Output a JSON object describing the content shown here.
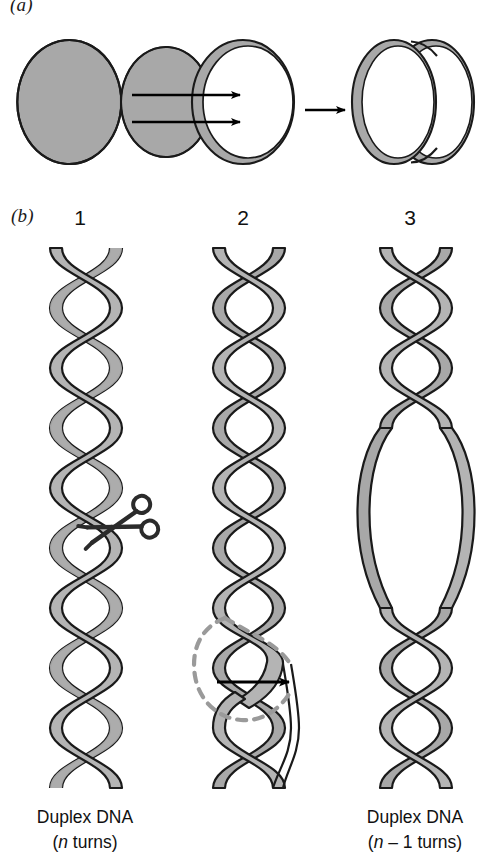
{
  "figure": {
    "title_domain": "DNA topology / supercoiling schematic",
    "background_color": "#ffffff",
    "ribbon_fill": "#a8a8a8",
    "ribbon_stroke": "#1a1a1a",
    "arrow_color": "#000000",
    "dashed_color": "#9a9a9a"
  },
  "panel_a": {
    "letter": "(a)",
    "shapes": [
      {
        "name": "nicked-open-circle",
        "description": "open C-shaped ribbon ring with gap on right"
      },
      {
        "name": "closed-circle",
        "description": "closed circular ribbon ring"
      },
      {
        "name": "supercoiled-double-loop",
        "description": "twisted figure-eight / interwound double loop"
      }
    ],
    "arrows": [
      {
        "name": "arrow-top",
        "count": 1
      },
      {
        "name": "arrow-bottom",
        "count": 1
      },
      {
        "name": "arrow-to-supercoil",
        "count": 1
      }
    ]
  },
  "panel_b": {
    "letter": "(b)",
    "helices": [
      {
        "number": "1",
        "name": "duplex-relaxed",
        "annotation": "scissors-icon",
        "caption_line1": "Duplex DNA",
        "caption_line2_prefix": "(",
        "caption_line2_italic": "n",
        "caption_line2_suffix": " turns)"
      },
      {
        "number": "2",
        "name": "duplex-nicked-rotating",
        "annotation": "dashed-rotation-curve-with-arrow",
        "caption_line1": "",
        "caption_line2_prefix": "",
        "caption_line2_italic": "",
        "caption_line2_suffix": ""
      },
      {
        "number": "3",
        "name": "duplex-underwound-bubble",
        "annotation": "open-bubble",
        "caption_line1": "Duplex DNA",
        "caption_line2_prefix": "(",
        "caption_line2_italic": "n",
        "caption_line2_suffix": " – 1 turns)"
      }
    ]
  },
  "captions": {
    "left": {
      "line1": "Duplex DNA",
      "line2_open": "(",
      "line2_var": "n",
      "line2_rest": " turns)"
    },
    "right": {
      "line1": "Duplex DNA",
      "line2_open": "(",
      "line2_var": "n",
      "line2_rest": " – 1 turns)"
    }
  }
}
